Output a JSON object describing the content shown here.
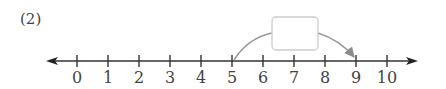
{
  "problem": {
    "label": "(2)"
  },
  "number_line": {
    "min": 0,
    "max": 10,
    "ticks": [
      "0",
      "1",
      "2",
      "3",
      "4",
      "5",
      "6",
      "7",
      "8",
      "9",
      "10"
    ],
    "arrow_both_ends": true
  },
  "jump": {
    "from": 5,
    "to": 9,
    "answer_box": "",
    "arrow_color": "#999999"
  },
  "colors": {
    "axis": "#333333",
    "box_border": "#cccccc"
  }
}
